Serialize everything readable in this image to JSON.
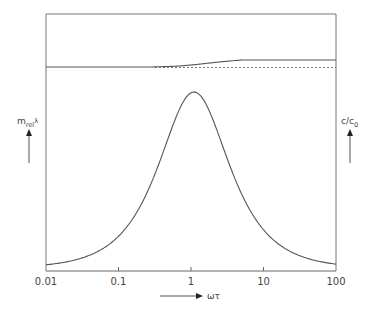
{
  "chart_data": {
    "type": "line",
    "title": "",
    "layout": "two stacked panels sharing a logarithmic x-axis",
    "xlabel": "ωτ",
    "xscale": "log",
    "xlim": [
      0.01,
      100
    ],
    "x_ticks": [
      "0.01",
      "0.1",
      "1",
      "10",
      "100"
    ],
    "grid": false,
    "legend": null,
    "panels": [
      {
        "position": "top",
        "ylabel": "c/c0",
        "ylabel_main": "c/c",
        "ylabel_sub": "0",
        "y_ticks": [],
        "series": [
          {
            "name": "c/c0 (dispersion)",
            "style": "solid",
            "x": [
              0.01,
              0.1,
              0.3,
              0.5,
              1,
              2,
              5,
              10,
              30,
              100
            ],
            "y": [
              1.0,
              1.0,
              1.0,
              1.02,
              1.06,
              1.1,
              1.13,
              1.14,
              1.15,
              1.15
            ]
          },
          {
            "name": "c0 reference",
            "style": "dashed",
            "x": [
              0.01,
              100
            ],
            "y": [
              1.0,
              1.0
            ]
          }
        ]
      },
      {
        "position": "bottom",
        "ylabel": "m_rel λ",
        "ylabel_main": "m",
        "ylabel_sub": "rel",
        "ylabel_tail": "λ",
        "y_ticks": [],
        "series": [
          {
            "name": "m_rel λ (absorption per wavelength)",
            "style": "solid",
            "peak_x": 1.1,
            "x": [
              0.01,
              0.02,
              0.05,
              0.1,
              0.2,
              0.5,
              1,
              1.1,
              2,
              5,
              10,
              20,
              50,
              100
            ],
            "y": [
              0.02,
              0.04,
              0.1,
              0.2,
              0.38,
              0.8,
              1.0,
              1.0,
              0.8,
              0.38,
              0.2,
              0.1,
              0.04,
              0.02
            ]
          }
        ]
      }
    ]
  },
  "labels": {
    "left_axis": {
      "main": "m",
      "sub": "rel",
      "tail": "λ"
    },
    "right_axis": {
      "main": "c/c",
      "sub": "0"
    },
    "x_axis": "ωτ",
    "x_ticks": [
      "0.01",
      "0.1",
      "1",
      "10",
      "100"
    ]
  },
  "colors": {
    "line": "#555555",
    "frame": "#777777",
    "text": "#444444"
  }
}
